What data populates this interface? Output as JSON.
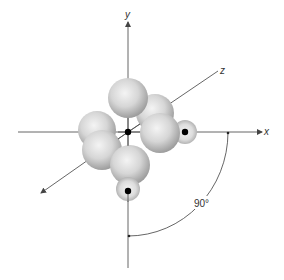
{
  "diagram": {
    "axes": {
      "x": {
        "label": "x"
      },
      "y": {
        "label": "y"
      },
      "z": {
        "label": "z"
      }
    },
    "angle_annotation": {
      "label": "90°"
    },
    "colors": {
      "axis": "#555555",
      "sphere_light": "#f2f2f2",
      "sphere_mid": "#cfcfcf",
      "sphere_dark": "#9a9a9a",
      "nucleus": "#000000"
    },
    "spheres": [
      {
        "name": "large-sphere-back-right",
        "cx": 155,
        "cy": 113,
        "r": 19
      },
      {
        "name": "large-sphere-left-back",
        "cx": 97,
        "cy": 130,
        "r": 19
      },
      {
        "name": "large-sphere-top",
        "cx": 128,
        "cy": 98,
        "r": 20
      },
      {
        "name": "small-sphere-right",
        "cx": 185,
        "cy": 132,
        "r": 12
      },
      {
        "name": "large-sphere-front-right",
        "cx": 160,
        "cy": 133,
        "r": 20
      },
      {
        "name": "large-sphere-left-front",
        "cx": 102,
        "cy": 150,
        "r": 20
      },
      {
        "name": "large-sphere-lower-center",
        "cx": 130,
        "cy": 165,
        "r": 20
      },
      {
        "name": "small-sphere-bottom",
        "cx": 128,
        "cy": 189,
        "r": 12
      }
    ],
    "nuclei": [
      {
        "name": "central-nucleus",
        "cx": 128,
        "cy": 132
      },
      {
        "name": "right-nucleus",
        "cx": 185,
        "cy": 132
      },
      {
        "name": "bottom-nucleus",
        "cx": 128,
        "cy": 191
      }
    ]
  }
}
